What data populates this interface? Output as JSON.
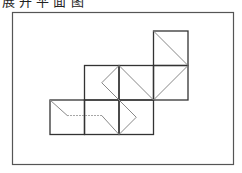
{
  "caption": "展 开 平 面 图",
  "figure": {
    "squares": [
      {
        "row": 0,
        "col": 3
      },
      {
        "row": 1,
        "col": 1
      },
      {
        "row": 1,
        "col": 2
      },
      {
        "row": 1,
        "col": 3
      },
      {
        "row": 2,
        "col": 0
      },
      {
        "row": 2,
        "col": 1
      },
      {
        "row": 2,
        "col": 2
      }
    ],
    "path_segments": [
      {
        "from": [
          3,
          0
        ],
        "to": [
          4,
          1
        ],
        "style": "solid"
      },
      {
        "from": [
          4,
          1
        ],
        "to": [
          3,
          2
        ],
        "style": "solid"
      },
      {
        "from": [
          2,
          1
        ],
        "to": [
          3,
          2
        ],
        "style": "solid"
      },
      {
        "from": [
          2,
          1
        ],
        "to": [
          1.5,
          1.5
        ],
        "style": "solid"
      },
      {
        "from": [
          1.5,
          1.5
        ],
        "to": [
          2,
          2
        ],
        "style": "solid"
      },
      {
        "from": [
          2,
          2
        ],
        "to": [
          2.5,
          2.5
        ],
        "style": "solid"
      },
      {
        "from": [
          2.5,
          2.5
        ],
        "to": [
          2,
          3
        ],
        "style": "solid"
      },
      {
        "from": [
          0,
          2
        ],
        "to": [
          0.5,
          2.45
        ],
        "style": "solid"
      },
      {
        "from": [
          0.5,
          2.45
        ],
        "to": [
          1.5,
          2.45
        ],
        "style": "dotted"
      },
      {
        "from": [
          1.5,
          2.45
        ],
        "to": [
          2,
          3
        ],
        "style": "solid"
      }
    ],
    "colors": {
      "frame": "#555555",
      "grid": "#333333",
      "path": "#888888"
    }
  }
}
